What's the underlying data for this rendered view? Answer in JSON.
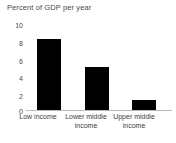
{
  "chart_data": {
    "type": "bar",
    "title": "Percent of GDP per year",
    "xlabel": "",
    "ylabel": "",
    "categories": [
      "Low income",
      "Lower middle income",
      "Upper middle income"
    ],
    "values": [
      8.1,
      5.0,
      1.2
    ],
    "ylim": [
      0,
      10
    ],
    "yticks": [
      10,
      8,
      6,
      4,
      2,
      0
    ],
    "ytick_labels": [
      "10",
      "8",
      "6",
      "4",
      "2",
      "0"
    ],
    "grid": false,
    "legend": false,
    "bar_color": "#000000",
    "axis_color": "#b9b9b9",
    "text_color": "#4a4a4a",
    "background": "#ffffff"
  },
  "labels": {
    "cat0": "Low income",
    "cat1_line1": "Lower middle",
    "cat1_line2": "income",
    "cat2_line1": "Upper middle",
    "cat2_line2": "income",
    "y10": "10",
    "y8": "8",
    "y6": "6",
    "y4": "4",
    "y2": "2",
    "y0": "0"
  }
}
